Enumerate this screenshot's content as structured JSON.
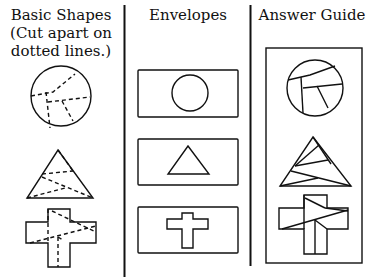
{
  "columns": [
    {
      "id": "basic-shapes",
      "title_lines": [
        "Basic Shapes",
        "(Cut apart on",
        "dotted lines.)"
      ]
    },
    {
      "id": "envelopes",
      "title_lines": [
        "Envelopes"
      ]
    },
    {
      "id": "answer-guide",
      "title_lines": [
        "Answer Guide"
      ]
    }
  ],
  "shapes": [
    "circle",
    "triangle",
    "cross"
  ],
  "colors": {
    "ink": "#111111",
    "background": "#ffffff"
  }
}
